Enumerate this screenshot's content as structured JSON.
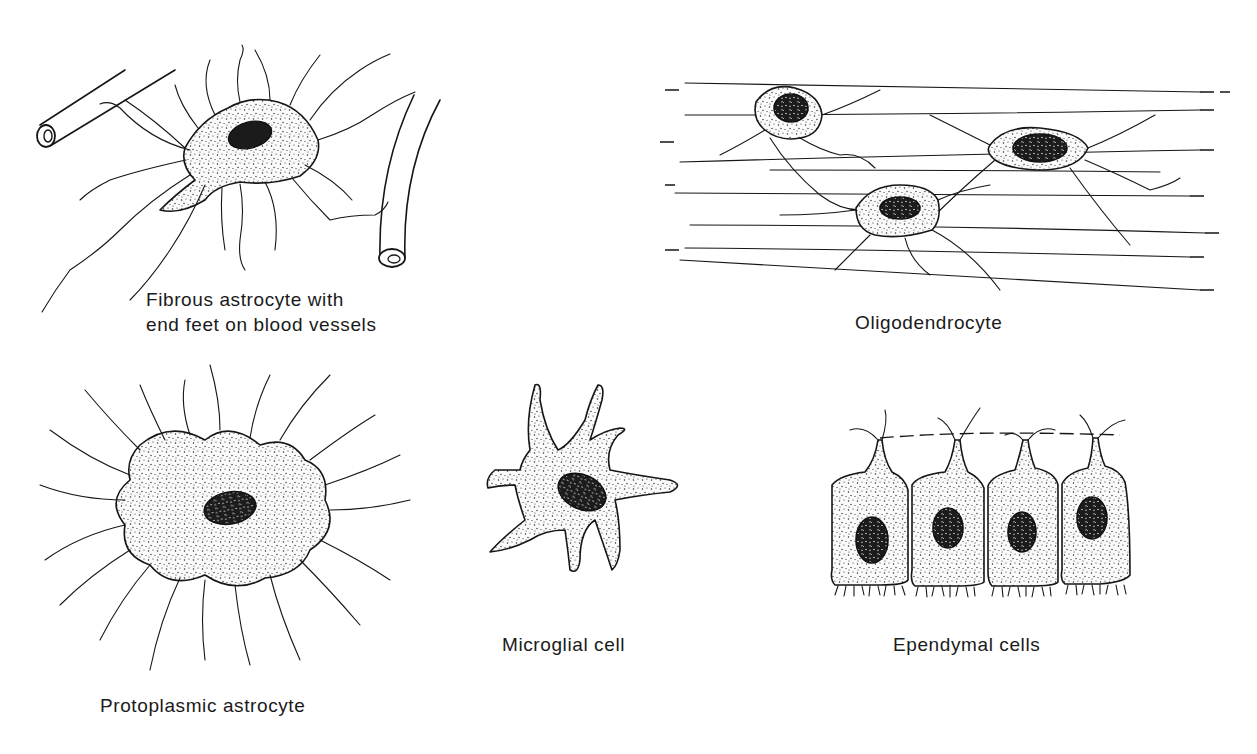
{
  "figure": {
    "panels": [
      {
        "id": "fibrous-astrocyte",
        "caption_line1": "Fibrous astrocyte with",
        "caption_line2": "end feet on blood vessels"
      },
      {
        "id": "oligodendrocyte",
        "caption": "Oligodendrocyte"
      },
      {
        "id": "protoplasmic-astrocyte",
        "caption": "Protoplasmic astrocyte"
      },
      {
        "id": "microglial-cell",
        "caption": "Microglial cell"
      },
      {
        "id": "ependymal-cells",
        "caption": "Ependymal cells"
      }
    ]
  },
  "colors": {
    "ink": "#161616",
    "background": "#ffffff"
  }
}
